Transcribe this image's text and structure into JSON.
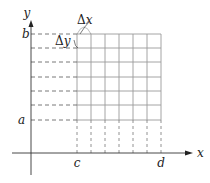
{
  "diagram": {
    "type": "riemann-grid-region",
    "axes": {
      "x_label": "x",
      "y_label": "y"
    },
    "ticks": {
      "x_left": "c",
      "x_right": "d",
      "y_bottom": "a",
      "y_top": "b"
    },
    "annotations": {
      "dx": "x",
      "dy": "y",
      "delta": "Δ"
    },
    "grid": {
      "columns": 6,
      "rows": 6
    },
    "colors": {
      "grid": "#9a9a9a",
      "axis": "#333333",
      "dashed": "#555555"
    }
  }
}
